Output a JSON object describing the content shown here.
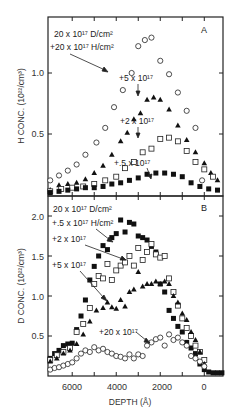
{
  "chart_data": [
    {
      "panel": "A",
      "type": "scatter",
      "ylabel": "H CONC. (10^22/cm^3)",
      "xlabel": "DEPTH (Å)",
      "x_reversed": true,
      "xlim": [
        7100,
        -850
      ],
      "ylim": [
        0,
        1.45
      ],
      "yticks": [
        0.5,
        1.0
      ],
      "ytick_labels": [
        "0.5",
        "1.0"
      ],
      "annotations": [
        "20 x 10^17 D/cm^2",
        "+20 x 10^17 H/cm^2",
        "+5 x 10^17",
        "+2 x 10^17",
        "+.5 x 10^17"
      ],
      "series": [
        {
          "name": "+20 x 10^17 H/cm^2",
          "marker": "open-circle",
          "x": [
            7000,
            6600,
            6200,
            5800,
            5400,
            4900,
            4500,
            4100,
            3700,
            3300,
            3000,
            2700,
            2400,
            2000,
            1600,
            1200,
            800,
            400,
            100
          ],
          "y": [
            0.12,
            0.16,
            0.2,
            0.25,
            0.33,
            0.43,
            0.55,
            0.72,
            0.86,
            1.0,
            1.22,
            1.27,
            1.29,
            1.1,
            0.99,
            0.84,
            0.69,
            0.55,
            0.12
          ]
        },
        {
          "name": "+5 x 10^17",
          "marker": "filled-triangle",
          "x": [
            7000,
            6600,
            6200,
            5800,
            5400,
            5000,
            4600,
            4200,
            3800,
            3500,
            3200,
            2900,
            2600,
            2300,
            2000,
            1600,
            1200,
            800,
            400,
            0,
            -300,
            -600
          ],
          "y": [
            0.04,
            0.08,
            0.09,
            0.1,
            0.13,
            0.18,
            0.24,
            0.33,
            0.44,
            0.51,
            0.62,
            0.67,
            0.78,
            0.8,
            0.78,
            0.7,
            0.57,
            0.45,
            0.35,
            0.26,
            0.18,
            0.12
          ]
        },
        {
          "name": "+2 x 10^17",
          "marker": "open-square",
          "x": [
            7000,
            6500,
            6000,
            5500,
            5000,
            4500,
            4000,
            3600,
            3200,
            2800,
            2400,
            2000,
            1600,
            1200,
            800,
            400,
            0,
            -400
          ],
          "y": [
            0.03,
            0.05,
            0.06,
            0.07,
            0.09,
            0.12,
            0.15,
            0.22,
            0.27,
            0.35,
            0.38,
            0.46,
            0.47,
            0.44,
            0.36,
            0.27,
            0.21,
            0.15
          ]
        },
        {
          "name": "+.5 x 10^17",
          "marker": "filled-square",
          "x": [
            7000,
            6600,
            6200,
            5800,
            5400,
            5000,
            4600,
            4200,
            3800,
            3400,
            3000,
            2600,
            2200,
            1800,
            1400,
            1000,
            600,
            200,
            -200,
            -600
          ],
          "y": [
            0.02,
            0.03,
            0.04,
            0.05,
            0.06,
            0.06,
            0.07,
            0.09,
            0.1,
            0.12,
            0.14,
            0.17,
            0.18,
            0.18,
            0.17,
            0.15,
            0.1,
            0.07,
            0.05,
            0.04
          ]
        }
      ]
    },
    {
      "panel": "B",
      "type": "scatter",
      "ylabel": "D CONC. (10^22/cm^3)",
      "xlabel": "DEPTH (Å)",
      "x_reversed": true,
      "xlim": [
        7100,
        -850
      ],
      "ylim": [
        0,
        2.2
      ],
      "yticks": [
        0.5,
        1.0,
        1.5,
        2.0
      ],
      "ytick_labels": [
        "0.5",
        "1.0",
        "1.5",
        "2.0"
      ],
      "xticks": [
        6000,
        4000,
        2000,
        0
      ],
      "xtick_labels": [
        "6000",
        "4000",
        "2000",
        "0"
      ],
      "annotations": [
        "20 x 10^17 D/cm^2",
        "+.5 x 10^17 H/cm^2",
        "+2 x 10^17",
        "+5 x 10^17",
        "+20 x 10^17"
      ],
      "series": [
        {
          "name": "+.5 x 10^17 H/cm^2",
          "marker": "filled-square",
          "x": [
            7000,
            6800,
            6600,
            6400,
            6200,
            6000,
            5800,
            5600,
            5400,
            5200,
            5000,
            4800,
            4600,
            4400,
            4200,
            4000,
            3800,
            3600,
            3400,
            3200,
            3000,
            2800,
            2600,
            2400,
            2200,
            2000,
            1800,
            1600,
            1400,
            1200,
            1000,
            800,
            600,
            400,
            200,
            0,
            -200,
            -400,
            -600,
            -800
          ],
          "y": [
            0.22,
            0.28,
            0.32,
            0.38,
            0.4,
            0.41,
            0.58,
            0.75,
            0.95,
            1.2,
            1.37,
            1.5,
            1.63,
            1.58,
            1.73,
            1.78,
            1.95,
            1.8,
            1.92,
            1.9,
            1.75,
            1.73,
            1.7,
            1.62,
            1.55,
            1.15,
            1.05,
            0.82,
            0.72,
            0.62,
            0.55,
            0.42,
            0.35,
            0.28,
            0.15,
            0.08,
            0.05,
            0.04,
            0.04,
            0.04
          ]
        },
        {
          "name": "+2 x 10^17",
          "marker": "open-square",
          "x": [
            7000,
            6700,
            6400,
            6100,
            5800,
            5500,
            5200,
            5000,
            4800,
            4600,
            4400,
            4200,
            4000,
            3800,
            3600,
            3400,
            3200,
            3000,
            2800,
            2600,
            2400,
            2200,
            2000,
            1800,
            1600,
            1400,
            1200,
            1000,
            800,
            600,
            400,
            200,
            0
          ],
          "y": [
            0.2,
            0.26,
            0.3,
            0.35,
            0.55,
            0.65,
            0.85,
            1.15,
            1.25,
            1.22,
            1.4,
            1.2,
            1.32,
            1.38,
            1.42,
            1.5,
            1.38,
            1.6,
            1.45,
            1.55,
            1.65,
            1.52,
            1.48,
            1.5,
            1.22,
            1.05,
            0.88,
            0.72,
            0.6,
            0.5,
            0.38,
            0.3,
            0.2
          ]
        },
        {
          "name": "+5 x 10^17",
          "marker": "filled-triangle",
          "x": [
            7000,
            6700,
            6400,
            6100,
            5800,
            5500,
            5200,
            4900,
            4600,
            4400,
            4200,
            4000,
            3800,
            3600,
            3400,
            3200,
            3000,
            2800,
            2600,
            2400,
            2200,
            2000,
            1800,
            1600,
            1400,
            1200,
            1000,
            800,
            600,
            400,
            200,
            0
          ],
          "y": [
            0.18,
            0.22,
            0.28,
            0.32,
            0.4,
            0.52,
            0.68,
            0.82,
            0.85,
            0.92,
            0.86,
            0.84,
            0.95,
            0.87,
            1.05,
            1.08,
            1.3,
            1.12,
            1.15,
            1.15,
            1.18,
            1.15,
            1.18,
            1.15,
            1.0,
            0.92,
            0.78,
            0.7,
            0.55,
            0.45,
            0.3,
            0.15
          ]
        },
        {
          "name": "+20 x 10^17",
          "marker": "open-circle",
          "x": [
            7000,
            6800,
            6600,
            6400,
            6200,
            6000,
            5800,
            5600,
            5400,
            5200,
            5000,
            4800,
            4600,
            4400,
            4200,
            4000,
            3800,
            3600,
            3400,
            3200,
            3000,
            2800,
            2600,
            2400,
            2200,
            2000,
            1800,
            1600,
            1400,
            1200,
            1000,
            800,
            600,
            400,
            200,
            0
          ],
          "y": [
            0.08,
            0.1,
            0.11,
            0.13,
            0.15,
            0.17,
            0.22,
            0.28,
            0.32,
            0.3,
            0.36,
            0.32,
            0.34,
            0.3,
            0.28,
            0.25,
            0.24,
            0.22,
            0.27,
            0.22,
            0.27,
            0.25,
            0.38,
            0.42,
            0.46,
            0.48,
            0.38,
            0.52,
            0.45,
            0.48,
            0.42,
            0.38,
            0.25,
            0.22,
            0.18,
            0.12
          ]
        }
      ]
    }
  ],
  "labels": {
    "panel_a": "A",
    "panel_b": "B",
    "ylabel_a": "H CONC. (10²²/cm³)",
    "ylabel_b": "D CONC. (10²²/cm³)",
    "xlabel": "DEPTH (Å)",
    "a_ann1": "20 x 10¹⁷ D/cm²",
    "a_ann2": "+20 x 10¹⁷ H/cm²",
    "a_ann3": "+5 x 10¹⁷",
    "a_ann4": "+2 x 10¹⁷",
    "a_ann5": "+.5 x 10¹⁷",
    "b_ann1": "20 x 10¹⁷ D/cm²",
    "b_ann2": "+.5 x 10¹⁷ H/cm²",
    "b_ann3": "+2 x 10¹⁷",
    "b_ann4": "+5 x 10¹⁷",
    "b_ann5": "+20 x 10¹⁷",
    "ytick_a": [
      "0.5",
      "1.0"
    ],
    "ytick_b": [
      "0.5",
      "1.0",
      "1.5",
      "2.0"
    ],
    "xtick": [
      "6000",
      "4000",
      "2000",
      "0"
    ]
  }
}
